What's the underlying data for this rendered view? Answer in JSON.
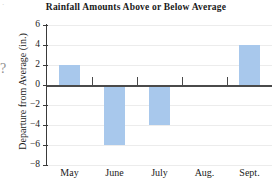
{
  "chart_data": {
    "type": "bar",
    "title": "Rainfall Amounts Above or Below Average",
    "xlabel": "",
    "ylabel": "Departure from Average (in.)",
    "categories": [
      "May",
      "June",
      "July",
      "Aug.",
      "Sept."
    ],
    "values": [
      2,
      -6,
      -4,
      0,
      4
    ],
    "series": [
      {
        "name": "Departure from Average",
        "values": [
          2,
          -6,
          -4,
          0,
          4
        ]
      }
    ],
    "ylim": [
      -8,
      6
    ],
    "ytick_labels": [
      "6",
      "4",
      "2",
      "0",
      "−2",
      "−4",
      "−6",
      "−8"
    ],
    "ytick_values": [
      6,
      4,
      2,
      0,
      -2,
      -4,
      -6,
      -8
    ],
    "grid": true,
    "legend": "none",
    "bar_color": "#a8c8ec",
    "axis_color": "#3a3a3a",
    "zero_line_color": "#4a4a4a",
    "gridline_color": "#ececec",
    "text_color": "#1a1a1a"
  },
  "artifacts": {
    "question_mark": "?",
    "corner_mark": "·"
  }
}
